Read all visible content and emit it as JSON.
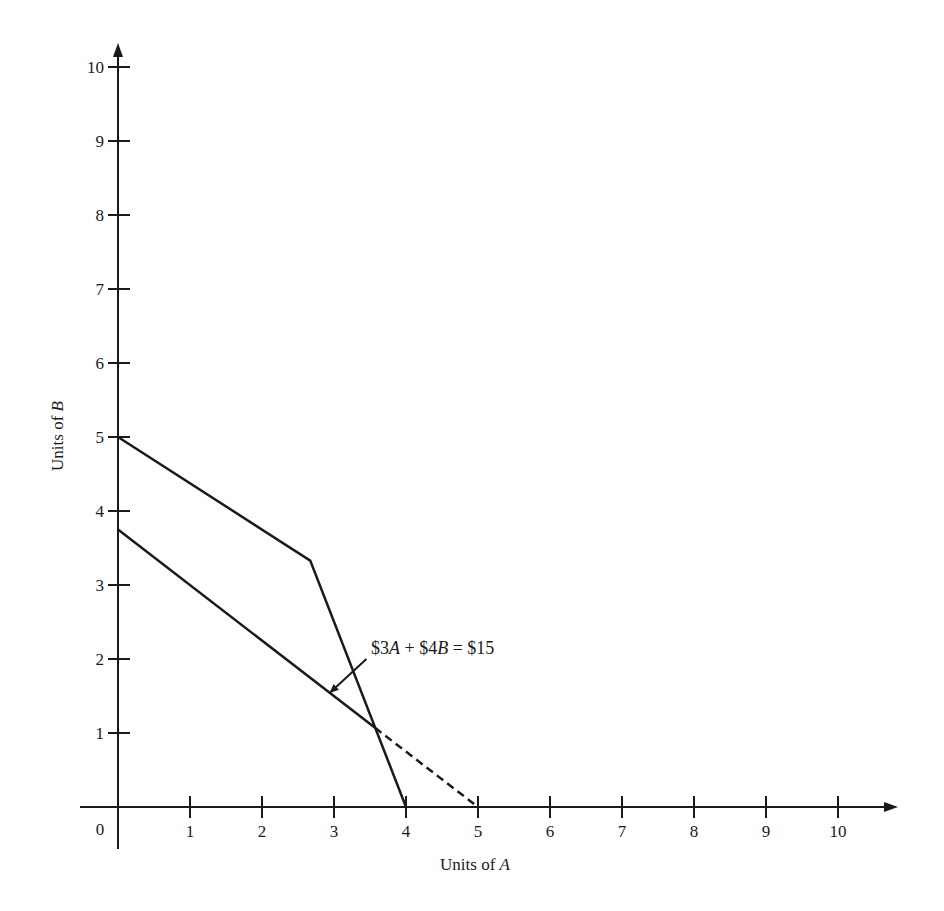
{
  "chart_data": {
    "type": "line",
    "title": "",
    "xlabel": "Units of A",
    "xlabel_var": "A",
    "xlabel_prefix": "Units of ",
    "ylabel": "Units of B",
    "ylabel_var": "B",
    "ylabel_prefix": "Units of ",
    "xlim": [
      0,
      10
    ],
    "ylim": [
      0,
      10
    ],
    "origin_label": "0",
    "x_ticks": [
      1,
      2,
      3,
      4,
      5,
      6,
      7,
      8,
      9,
      10
    ],
    "y_ticks": [
      1,
      2,
      3,
      4,
      5,
      6,
      7,
      8,
      9,
      10
    ],
    "grid": false,
    "legend": null,
    "series": [
      {
        "name": "Feasible frontier (kinked constraint)",
        "style": "solid",
        "points": [
          [
            0,
            5
          ],
          [
            2.67,
            3.33
          ],
          [
            4,
            0
          ]
        ]
      },
      {
        "name": "$3A + $4B = $15 (isocost line)",
        "style": "solid",
        "points": [
          [
            0,
            3.75
          ],
          [
            3.57,
            1.07
          ]
        ]
      },
      {
        "name": "$3A + $4B = $15 (extension)",
        "style": "dashed",
        "points": [
          [
            3.57,
            1.07
          ],
          [
            5,
            0
          ]
        ]
      }
    ],
    "annotations": [
      {
        "text": "$3A + $4B = $15",
        "text_position": [
          3.5,
          2.15
        ],
        "arrow_from": [
          3.45,
          2.0
        ],
        "arrow_to": [
          2.95,
          1.55
        ]
      }
    ]
  },
  "labels": {
    "annotation_parts": [
      "$3",
      "A",
      " + $4",
      "B",
      " = $15"
    ]
  }
}
